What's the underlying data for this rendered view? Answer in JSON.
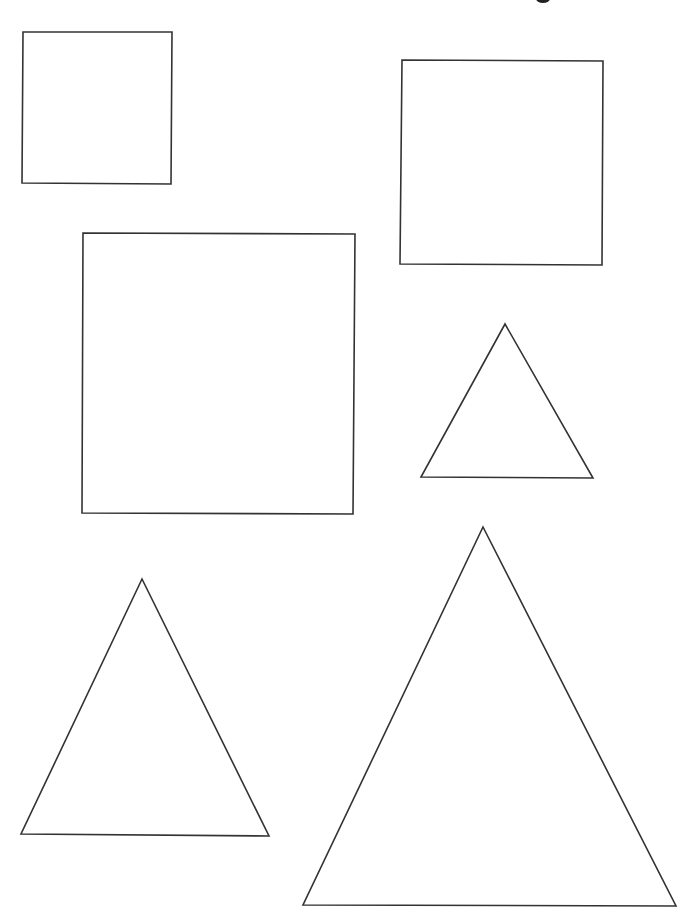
{
  "worksheet": {
    "stroke_color": "#333333",
    "stroke_width": 1.6,
    "fill_color": "#ffffff",
    "shapes": [
      {
        "kind": "square",
        "size": "small",
        "points": "23,32 172,32 171,184 22,183"
      },
      {
        "kind": "square",
        "size": "medium",
        "points": "402,60 603,61 602,265 400,264"
      },
      {
        "kind": "square",
        "size": "large",
        "points": "83,233 355,234 353,514 82,513"
      },
      {
        "kind": "triangle",
        "size": "small",
        "points": "505,324 593,478 421,477"
      },
      {
        "kind": "triangle",
        "size": "medium",
        "points": "142,579 269,836 21,834"
      },
      {
        "kind": "triangle",
        "size": "large",
        "points": "483,527 676,906 303,905"
      }
    ]
  }
}
